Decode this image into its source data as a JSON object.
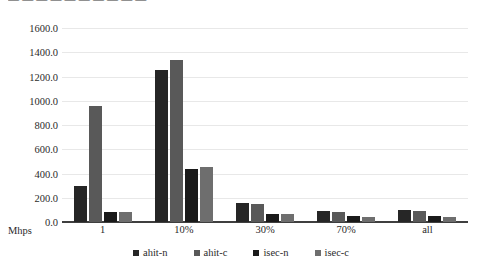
{
  "title_strip": {
    "text": "— — — — — — — — — —"
  },
  "axis": {
    "y_title": "Mhps",
    "y_ticks": [
      "1600.0",
      "1400.0",
      "1200.0",
      "1000.0",
      "800.0",
      "600.0",
      "400.0",
      "200.0",
      "0.0"
    ]
  },
  "legend": {
    "items": [
      {
        "label": "ahit-n",
        "color": "#262626"
      },
      {
        "label": "ahit-c",
        "color": "#595959"
      },
      {
        "label": "isec-n",
        "color": "#1a1a1a"
      },
      {
        "label": "isec-c",
        "color": "#6e6e6e"
      }
    ]
  },
  "chart_data": {
    "type": "bar",
    "title": "",
    "xlabel": "",
    "ylabel": "Mhps",
    "ylim": [
      0,
      1600
    ],
    "ytick_step": 200,
    "grid": true,
    "legend_position": "bottom",
    "categories": [
      "1",
      "10%",
      "30%",
      "70%",
      "all"
    ],
    "series": [
      {
        "name": "ahit-n",
        "color": "#262626",
        "values": [
          300,
          1250,
          155,
          90,
          95
        ]
      },
      {
        "name": "ahit-c",
        "color": "#595959",
        "values": [
          960,
          1340,
          150,
          85,
          90
        ]
      },
      {
        "name": "isec-n",
        "color": "#1a1a1a",
        "values": [
          85,
          440,
          70,
          50,
          50
        ]
      },
      {
        "name": "isec-c",
        "color": "#6e6e6e",
        "values": [
          85,
          450,
          65,
          45,
          45
        ]
      }
    ]
  }
}
